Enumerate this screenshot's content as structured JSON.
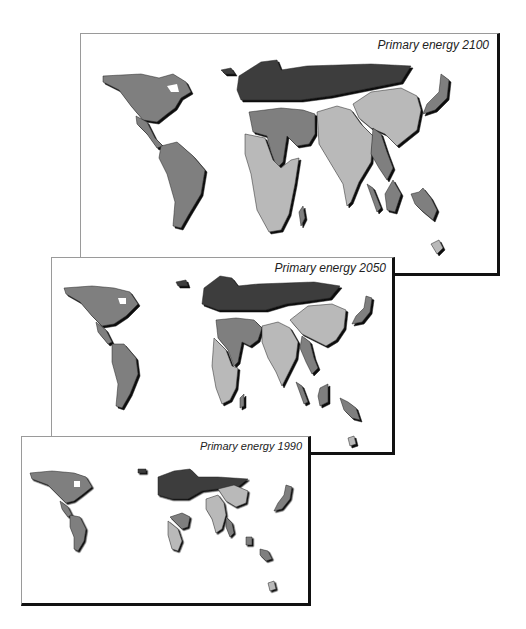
{
  "panels": [
    {
      "id": "2100",
      "title": "Primary energy 2100",
      "year": 2100
    },
    {
      "id": "2050",
      "title": "Primary energy 2050",
      "year": 2050
    },
    {
      "id": "1990",
      "title": "Primary energy 1990",
      "year": 1990
    }
  ],
  "shading": {
    "dark_region": "#3c3c3c",
    "medium_region": "#7f7f7f",
    "light_region": "#b9b9b9",
    "shadow": "#111111",
    "background": "#ffffff"
  },
  "regions": [
    {
      "name": "North America",
      "shade": "medium"
    },
    {
      "name": "Latin America",
      "shade": "medium"
    },
    {
      "name": "Europe / Former USSR",
      "shade": "dark"
    },
    {
      "name": "Middle East & North Africa",
      "shade": "medium"
    },
    {
      "name": "Sub-Saharan Africa",
      "shade": "light"
    },
    {
      "name": "South Asia",
      "shade": "light"
    },
    {
      "name": "Centrally Planned Asia",
      "shade": "light"
    },
    {
      "name": "Southeast Asia",
      "shade": "medium"
    },
    {
      "name": "Pacific OECD",
      "shade": "medium"
    }
  ]
}
